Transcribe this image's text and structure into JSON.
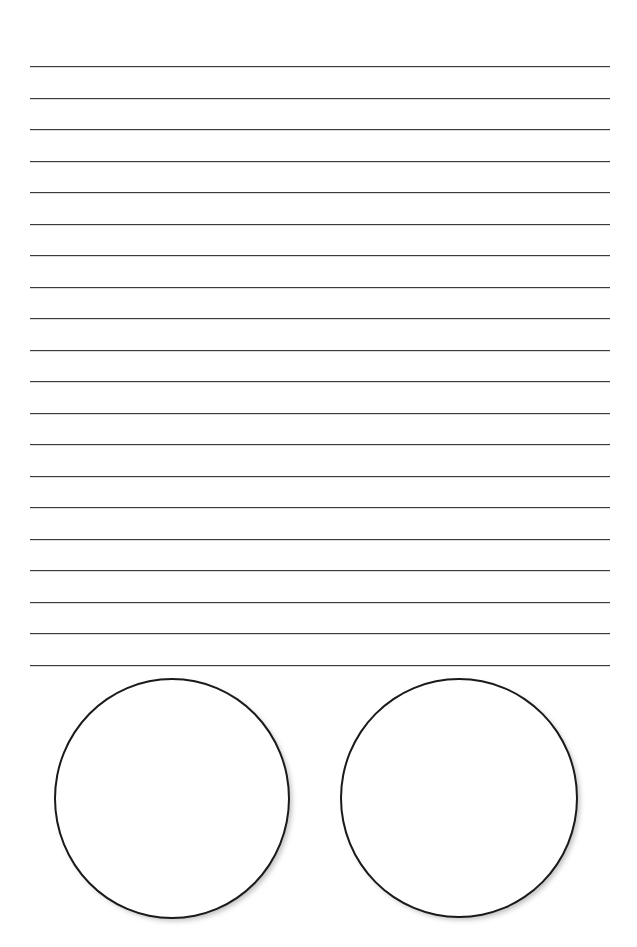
{
  "page": {
    "background_color": "#ffffff",
    "width": 637,
    "height": 947
  },
  "ruled_area": {
    "name": "writing-lines",
    "line_count": 20,
    "line_color": "#3b3b3e",
    "line_thickness_px": 1.6,
    "line_left_px": 30,
    "line_right_px": 610,
    "line_width_px": 580,
    "first_line_y_px": 66,
    "line_spacing_px": 31.5,
    "last_line_y_px": 665,
    "line_y_positions": [
      66,
      97.5,
      129,
      160.5,
      192,
      223.5,
      255,
      286.5,
      318,
      349.5,
      381,
      412.5,
      444,
      475.5,
      507,
      538.5,
      570,
      601.5,
      633,
      664.5
    ],
    "text_content": ""
  },
  "shapes": {
    "name": "circle-pair",
    "count": 2,
    "stroke_color": "#1a1a1c",
    "fill_color": "#ffffff",
    "stroke_thickness_px": 2.6,
    "items": [
      {
        "name": "circle-left",
        "label": "",
        "left_px": 54,
        "top_px": 8,
        "width_px": 236,
        "height_px": 241
      },
      {
        "name": "circle-right",
        "label": "",
        "left_px": 340,
        "top_px": 8,
        "width_px": 238,
        "height_px": 240
      }
    ]
  }
}
